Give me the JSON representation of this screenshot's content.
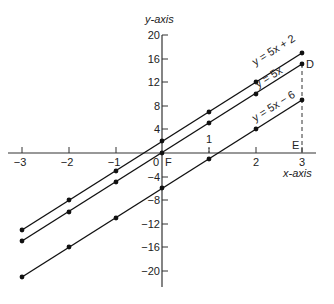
{
  "diagram": {
    "y_axis_label": "y-axis",
    "x_axis_label": "x-axis",
    "x_ticks": [
      {
        "value": -3,
        "label": "−3"
      },
      {
        "value": -2,
        "label": "−2"
      },
      {
        "value": -1,
        "label": "−1"
      },
      {
        "value": 1,
        "label": "1"
      },
      {
        "value": 2,
        "label": "2"
      },
      {
        "value": 3,
        "label": "3"
      }
    ],
    "y_ticks": [
      {
        "value": 20,
        "label": "20"
      },
      {
        "value": 16,
        "label": "16"
      },
      {
        "value": 12,
        "label": "12"
      },
      {
        "value": 8,
        "label": "8"
      },
      {
        "value": 4,
        "label": "4"
      },
      {
        "value": -4,
        "label": "−4"
      },
      {
        "value": -8,
        "label": "−8"
      },
      {
        "value": -12,
        "label": "−12"
      },
      {
        "value": -16,
        "label": "−16"
      },
      {
        "value": -20,
        "label": "−20"
      }
    ],
    "origin_label": "0",
    "points": {
      "F": "F",
      "D": "D",
      "E": "E"
    },
    "lines": [
      {
        "label": "y = 5x + 2",
        "slope": 5,
        "intercept": 2
      },
      {
        "label": "y = 5x",
        "slope": 5,
        "intercept": 0
      },
      {
        "label": "y = 5x − 6",
        "slope": 5,
        "intercept": -6
      }
    ],
    "extra_tick_label": "1"
  }
}
